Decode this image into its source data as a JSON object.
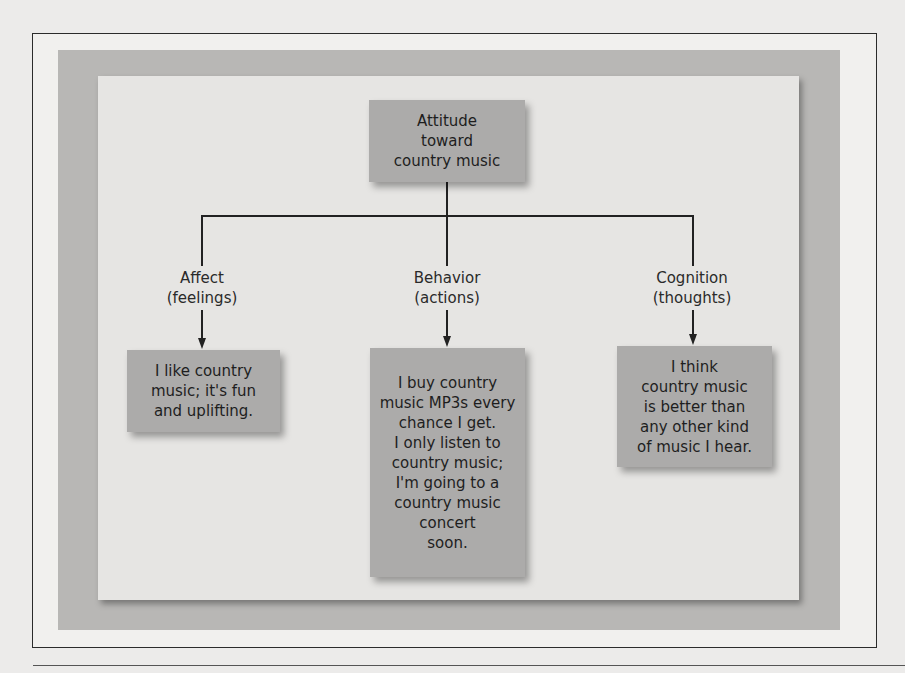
{
  "diagram": {
    "root": {
      "label": "Attitude\ntoward\ncountry music"
    },
    "components": [
      {
        "label": "Affect\n(feelings)",
        "example": "I like country\nmusic; it's fun\nand uplifting."
      },
      {
        "label": "Behavior\n(actions)",
        "example": "I buy country\nmusic MP3s every\nchance I get.\nI only listen to\ncountry music;\nI'm going to a\ncountry music\nconcert\nsoon."
      },
      {
        "label": "Cognition\n(thoughts)",
        "example": "I think\ncountry music\nis better than\nany other kind\nof music I hear."
      }
    ]
  },
  "colors": {
    "box_fill": "#acabaa",
    "panel": "#e6e5e3",
    "band": "#b8b7b5",
    "line": "#222222"
  }
}
